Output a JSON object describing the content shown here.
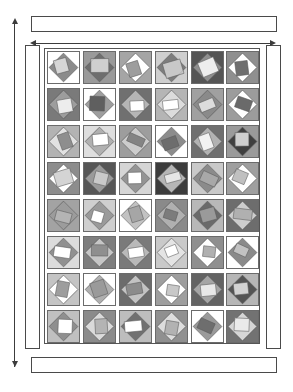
{
  "diagram": {
    "type": "quilt-layout",
    "grid": {
      "rows": 8,
      "columns": 6,
      "block_count": 48
    },
    "borders": {
      "top_label": "top border strip",
      "bottom_label": "bottom border strip",
      "left_label": "left border strip",
      "right_label": "right border strip"
    },
    "dimensions": {
      "height_arrow_label": "",
      "width_arrow_label": ""
    }
  },
  "palette": {
    "white": "#ffffff",
    "light": "#d8d8d8",
    "light2": "#c6c6c6",
    "mid": "#a8a8a8",
    "mid2": "#949494",
    "dark": "#787878",
    "darker": "#5e5e5e",
    "darkest": "#474747",
    "outline": "#5a5a5a",
    "sashing": "#ffffff"
  },
  "chart_data": {
    "type": "table",
    "note": "Each cell lists background, diamond and center patch tones",
    "blocks": [
      [
        {
          "bg": "#ffffff",
          "dia": "#8b8b8b",
          "ctr": "#d6d6d6"
        },
        {
          "bg": "#9a9a9a",
          "dia": "#6e6e6e",
          "ctr": "#cfcfcf"
        },
        {
          "bg": "#a5a5a5",
          "dia": "#ffffff",
          "ctr": "#9d9d9d"
        },
        {
          "bg": "#cfcfcf",
          "dia": "#7d7d7d",
          "ctr": "#c8c8c8"
        },
        {
          "bg": "#555555",
          "dia": "#8e8e8e",
          "ctr": "#ededed"
        },
        {
          "bg": "#8f8f8f",
          "dia": "#ffffff",
          "ctr": "#6f6f6f"
        }
      ],
      [
        {
          "bg": "#7a7a7a",
          "dia": "#9d9d9d",
          "ctr": "#ededed"
        },
        {
          "bg": "#ffffff",
          "dia": "#9e9e9e",
          "ctr": "#5f5f5f"
        },
        {
          "bg": "#707070",
          "dia": "#b5b5b5",
          "ctr": "#ffffff"
        },
        {
          "bg": "#b5b5b5",
          "dia": "#dcdcdc",
          "ctr": "#ffffff"
        },
        {
          "bg": "#a0a0a0",
          "dia": "#8a8a8a",
          "ctr": "#dcdcdc"
        },
        {
          "bg": "#9c9c9c",
          "dia": "#ffffff",
          "ctr": "#6a6a6a"
        }
      ],
      [
        {
          "bg": "#b3b3b3",
          "dia": "#e2e2e2",
          "ctr": "#8e8e8e"
        },
        {
          "bg": "#dedede",
          "dia": "#b0b0b0",
          "ctr": "#ffffff"
        },
        {
          "bg": "#9d9d9d",
          "dia": "#cccccc",
          "ctr": "#848484"
        },
        {
          "bg": "#ffffff",
          "dia": "#8c8c8c",
          "ctr": "#6d6d6d"
        },
        {
          "bg": "#6f6f6f",
          "dia": "#b2b2b2",
          "ctr": "#f2f2f2"
        },
        {
          "bg": "#9a9a9a",
          "dia": "#3f3f3f",
          "ctr": "#cecece"
        }
      ],
      [
        {
          "bg": "#8d8d8d",
          "dia": "#ffffff",
          "ctr": "#d4d4d4"
        },
        {
          "bg": "#565656",
          "dia": "#9a9a9a",
          "ctr": "#c9c9c9"
        },
        {
          "bg": "#d5d5d5",
          "dia": "#949494",
          "ctr": "#ffffff"
        },
        {
          "bg": "#3c3c3c",
          "dia": "#b6b6b6",
          "ctr": "#e6e6e6"
        },
        {
          "bg": "#c9c9c9",
          "dia": "#8b8b8b",
          "ctr": "#a8a8a8"
        },
        {
          "bg": "#9f9f9f",
          "dia": "#ffffff",
          "ctr": "#c0c0c0"
        }
      ],
      [
        {
          "bg": "#a3a3a3",
          "dia": "#9c9c9c",
          "ctr": "#b4b4b4"
        },
        {
          "bg": "#cfcfcf",
          "dia": "#9a9a9a",
          "ctr": "#ffffff"
        },
        {
          "bg": "#ffffff",
          "dia": "#c2c2c2",
          "ctr": "#a6a6a6"
        },
        {
          "bg": "#8a8a8a",
          "dia": "#b0b0b0",
          "ctr": "#7c7c7c"
        },
        {
          "bg": "#b8b8b8",
          "dia": "#6a6a6a",
          "ctr": "#9a9a9a"
        },
        {
          "bg": "#6d6d6d",
          "dia": "#cdcdcd",
          "ctr": "#b0b0b0"
        }
      ],
      [
        {
          "bg": "#dcdcdc",
          "dia": "#909090",
          "ctr": "#ffffff"
        },
        {
          "bg": "#7e7e7e",
          "dia": "#c6c6c6",
          "ctr": "#8f8f8f"
        },
        {
          "bg": "#7a7a7a",
          "dia": "#b9b9b9",
          "ctr": "#ffffff"
        },
        {
          "bg": "#c9c9c9",
          "dia": "#e4e4e4",
          "ctr": "#ffffff"
        },
        {
          "bg": "#8f8f8f",
          "dia": "#ffffff",
          "ctr": "#b0b0b0"
        },
        {
          "bg": "#ffffff",
          "dia": "#8a8a8a",
          "ctr": "#c2c2c2"
        }
      ],
      [
        {
          "bg": "#c4c4c4",
          "dia": "#ffffff",
          "ctr": "#9d9d9d"
        },
        {
          "bg": "#ffffff",
          "dia": "#b0b0b0",
          "ctr": "#9a9a9a"
        },
        {
          "bg": "#6c6c6c",
          "dia": "#c3c3c3",
          "ctr": "#8c8c8c"
        },
        {
          "bg": "#9e9e9e",
          "dia": "#ffffff",
          "ctr": "#c8c8c8"
        },
        {
          "bg": "#636363",
          "dia": "#a5a5a5",
          "ctr": "#e8e8e8"
        },
        {
          "bg": "#b6b6b6",
          "dia": "#545454",
          "ctr": "#d2d2d2"
        }
      ],
      [
        {
          "bg": "#c0c0c0",
          "dia": "#8f8f8f",
          "ctr": "#ffffff"
        },
        {
          "bg": "#8b8b8b",
          "dia": "#dadada",
          "ctr": "#b4b4b4"
        },
        {
          "bg": "#bdbdbd",
          "dia": "#717171",
          "ctr": "#ffffff"
        },
        {
          "bg": "#909090",
          "dia": "#dddddd",
          "ctr": "#b2b2b2"
        },
        {
          "bg": "#ffffff",
          "dia": "#9a9a9a",
          "ctr": "#6e6e6e"
        },
        {
          "bg": "#727272",
          "dia": "#d6d6d6",
          "ctr": "#eaeaea"
        }
      ]
    ]
  }
}
